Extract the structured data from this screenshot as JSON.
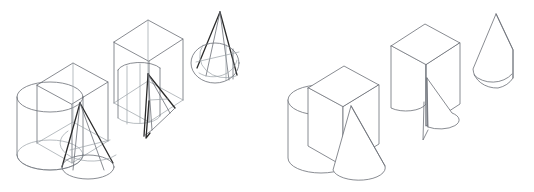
{
  "figure": {
    "background_color": "#ffffff",
    "width": 534,
    "height": 192,
    "has_text_labels": false,
    "render_modes": [
      {
        "id": "wireframe",
        "label": "Wireframe",
        "description": "All edges visible including hidden lines"
      },
      {
        "id": "hidden-line",
        "label": "Hidden line removed",
        "description": "Opaque shaded white faces, hidden edges suppressed"
      }
    ],
    "colors": {
      "edge_normal": "#6b6f76",
      "edge_faint": "#9aa0a6",
      "edge_highlight": "#2b2b2b",
      "face": "#ffffff"
    }
  },
  "groups": [
    {
      "id": "wireframe-group",
      "label": "Wireframe rendering",
      "mode": "wireframe",
      "objects": [
        {
          "id": "assembly-wireframe",
          "label": "Cylinder, box and cone assembly",
          "primitives": [
            "cylinder",
            "box",
            "cone"
          ],
          "operation": "union",
          "x": 12,
          "y": 60,
          "w": 122,
          "h": 122
        },
        {
          "id": "box-cut-wireframe",
          "label": "Box with cylinder and cone subtracted",
          "primitives": [
            "box",
            "cylinder",
            "cone"
          ],
          "operation": "difference",
          "x": 110,
          "y": 16,
          "w": 78,
          "h": 128
        },
        {
          "id": "cone-cylinder-wireframe",
          "label": "Cone intersected with cylinder",
          "primitives": [
            "cone",
            "cylinder"
          ],
          "operation": "intersection",
          "x": 190,
          "y": 8,
          "w": 62,
          "h": 84
        }
      ]
    },
    {
      "id": "hiddenline-group",
      "label": "Hidden line removed rendering",
      "mode": "hidden-line",
      "objects": [
        {
          "id": "assembly-solid",
          "label": "Cylinder, box and cone assembly",
          "primitives": [
            "cylinder",
            "box",
            "cone"
          ],
          "operation": "union",
          "x": 283,
          "y": 62,
          "w": 122,
          "h": 120
        },
        {
          "id": "box-cut-solid",
          "label": "Box with cylinder and cone subtracted",
          "primitives": [
            "box",
            "cylinder",
            "cone"
          ],
          "operation": "difference",
          "x": 388,
          "y": 20,
          "w": 74,
          "h": 122
        },
        {
          "id": "cone-cylinder-solid",
          "label": "Cone intersected with cylinder",
          "primitives": [
            "cone",
            "cylinder"
          ],
          "operation": "intersection",
          "x": 466,
          "y": 10,
          "w": 58,
          "h": 82
        }
      ]
    }
  ]
}
